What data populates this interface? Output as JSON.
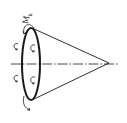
{
  "diagram": {
    "type": "cone-torque",
    "label": {
      "main": "M",
      "subscript": "k"
    },
    "colors": {
      "stroke": "#1a1a1a",
      "background": "#ffffff"
    },
    "elements": [
      "cone-base-ellipse",
      "cone-upper-generatrix",
      "cone-lower-generatrix",
      "dash-dot-axis",
      "moment-arrows"
    ]
  }
}
